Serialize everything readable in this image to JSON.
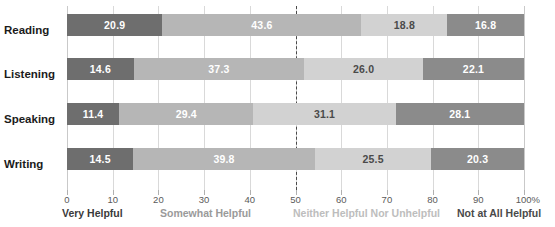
{
  "chart_data": {
    "type": "bar",
    "orientation": "horizontal",
    "stacked": true,
    "normalized_percent": true,
    "title": "",
    "subtitle": "",
    "xlabel": "",
    "ylabel": "",
    "xlim": [
      0,
      100
    ],
    "grid": true,
    "legend_position": "bottom",
    "categories": [
      "Reading",
      "Listening",
      "Speaking",
      "Writing"
    ],
    "series": [
      {
        "name": "Very Helpful",
        "color": "#6e6e6e",
        "values": [
          20.9,
          14.6,
          11.4,
          14.5
        ]
      },
      {
        "name": "Somewhat Helpful",
        "color": "#b6b6b6",
        "values": [
          43.6,
          37.3,
          29.4,
          39.8
        ]
      },
      {
        "name": "Neither Helpful Nor Unhelpful",
        "color": "#d2d2d2",
        "values": [
          18.8,
          26.0,
          31.1,
          25.5
        ]
      },
      {
        "name": "Not at All Helpful",
        "color": "#8b8b8b",
        "values": [
          16.8,
          22.1,
          28.1,
          20.3
        ]
      }
    ],
    "tick_values": [
      0,
      10,
      20,
      30,
      40,
      50,
      60,
      70,
      80,
      90,
      100
    ],
    "tick_labels": [
      "0",
      "10",
      "20",
      "30",
      "40",
      "50",
      "60",
      "70",
      "80",
      "90",
      "100%"
    ],
    "annotations": [
      {
        "type": "reference-line",
        "value": 50,
        "style": "dashed",
        "color": "#4a4a4a"
      }
    ],
    "bar_labels": [
      [
        "20.9",
        "43.6",
        "18.8",
        "16.8"
      ],
      [
        "14.6",
        "37.3",
        "26.0",
        "22.1"
      ],
      [
        "11.4",
        "29.4",
        "31.1",
        "28.1"
      ],
      [
        "14.5",
        "39.8",
        "25.5",
        "20.3"
      ]
    ]
  },
  "legend": {
    "items": [
      {
        "label": "Very Helpful",
        "color": "#3a3a3a"
      },
      {
        "label": "Somewhat Helpful",
        "color": "#9a9a9a"
      },
      {
        "label": "Neither Helpful Nor Unhelpful",
        "color": "#bdbdbd"
      },
      {
        "label": "Not at All Helpful",
        "color": "#4a4a4a"
      }
    ]
  }
}
